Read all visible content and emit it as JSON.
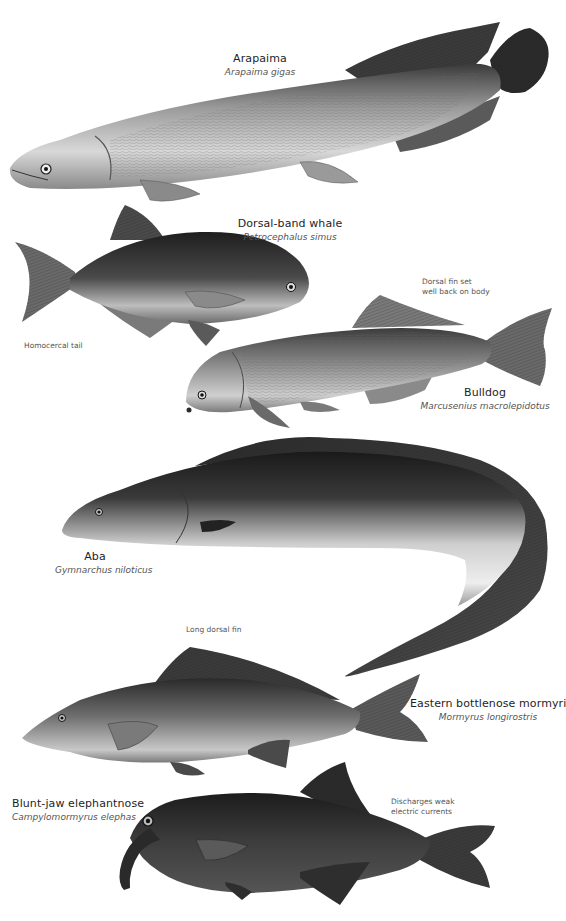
{
  "plate": {
    "background": "#ffffff",
    "ink_dark": "#1a1a1a",
    "ink_mid": "#7a7a7a",
    "ink_light": "#e2e2e2"
  },
  "species": [
    {
      "id": "arapaima",
      "common": "Arapaima",
      "latin": "Arapaima gigas"
    },
    {
      "id": "dorsal-band-whale",
      "common": "Dorsal-band whale",
      "latin": "Petrocephalus simus"
    },
    {
      "id": "bulldog",
      "common": "Bulldog",
      "latin": "Marcusenius macrolepidotus"
    },
    {
      "id": "aba",
      "common": "Aba",
      "latin": "Gymnarchus niloticus"
    },
    {
      "id": "eastern-bottlenose-mormyrid",
      "common": "Eastern bottlenose mormyrid",
      "latin": "Mormyrus longirostris"
    },
    {
      "id": "blunt-jaw-elephantnose",
      "common": "Blunt-jaw elephantnose",
      "latin": "Campylomormyrus elephas"
    }
  ],
  "notes": {
    "homocercal_tail": "Homocercal tail",
    "dorsal_fin_back": "Dorsal fin set\nwell back on body",
    "long_dorsal_fin": "Long dorsal fin",
    "electric_currents": "Discharges weak\nelectric currents"
  }
}
